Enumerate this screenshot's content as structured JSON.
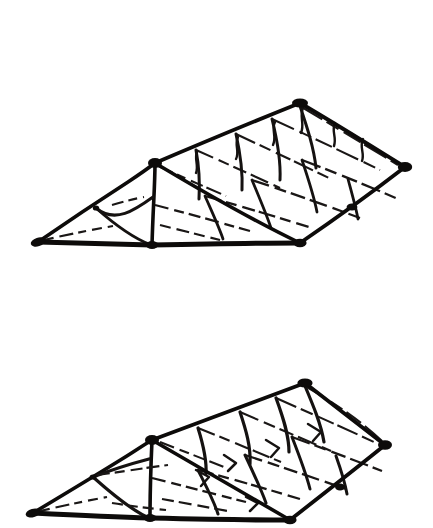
{
  "plate": {
    "title": "Hipped Roof Framing Illustrations",
    "background_color": "#ffffff",
    "ink_color": "#0d0b0a",
    "width": 433,
    "height": 528,
    "medium": "ink line drawing",
    "figure_count": 2
  },
  "figures": [
    {
      "id": "figure-top",
      "name": "upper-roof-framing-diagram",
      "caption": "",
      "projection": "axonometric",
      "subject": "hipped roof frame with triangulated hip end and bayed main slope",
      "bounds": {
        "x": 30,
        "y": 95,
        "width": 382,
        "height": 160
      },
      "vertices": {
        "west-eave-tip": [
          38,
          242
        ],
        "hip-node": [
          155,
          163
        ],
        "ridge-apex": [
          300,
          103
        ],
        "east-apex": [
          405,
          167
        ],
        "eave-mid-junction": [
          152,
          245
        ],
        "eave-south-corner": [
          300,
          243
        ],
        "eave-east-return": [
          352,
          213
        ]
      },
      "members": [
        "west hip rafter",
        "ridge board",
        "east hip rafter",
        "eave plate / wall plate",
        "common rafters",
        "purlins",
        "king post",
        "diagonal braces"
      ],
      "bay_count": 4
    },
    {
      "id": "figure-bottom",
      "name": "lower-roof-framing-diagram",
      "caption": "",
      "projection": "axonometric",
      "subject": "hipped roof frame with collar-tied hip end and bayed main slope",
      "bounds": {
        "x": 25,
        "y": 375,
        "width": 365,
        "height": 153
      },
      "vertices": {
        "west-eave-tip": [
          33,
          513
        ],
        "hip-node": [
          152,
          440
        ],
        "ridge-apex": [
          305,
          383
        ],
        "east-apex": [
          385,
          445
        ],
        "eave-mid-junction": [
          150,
          518
        ],
        "eave-south-corner": [
          290,
          520
        ],
        "eave-east-return": [
          340,
          490
        ]
      },
      "members": [
        "west hip rafter",
        "ridge board",
        "east hip rafter",
        "eave plate / wall plate",
        "common rafters",
        "purlins",
        "collar tie",
        "diagonal braces"
      ],
      "bay_count": 4
    }
  ]
}
